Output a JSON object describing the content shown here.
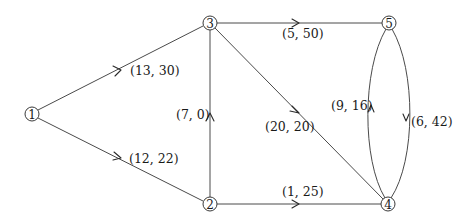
{
  "diagram": {
    "type": "directed-network-flow-graph",
    "nodes": [
      {
        "id": "1",
        "label": "1",
        "x": 32,
        "y": 114
      },
      {
        "id": "2",
        "label": "2",
        "x": 210,
        "y": 204
      },
      {
        "id": "3",
        "label": "3",
        "x": 210,
        "y": 23
      },
      {
        "id": "4",
        "label": "4",
        "x": 388,
        "y": 204
      },
      {
        "id": "5",
        "label": "5",
        "x": 389,
        "y": 23
      }
    ],
    "edges": [
      {
        "from": "1",
        "to": "3",
        "label": "(13, 30)"
      },
      {
        "from": "1",
        "to": "2",
        "label": "(12, 22)"
      },
      {
        "from": "2",
        "to": "3",
        "label": "(7, 0)"
      },
      {
        "from": "3",
        "to": "5",
        "label": "(5, 50)"
      },
      {
        "from": "3",
        "to": "4",
        "label": "(20, 20)"
      },
      {
        "from": "2",
        "to": "4",
        "label": "(1, 25)"
      },
      {
        "from": "4",
        "to": "5",
        "label": "(9, 16)"
      },
      {
        "from": "5",
        "to": "4",
        "label": "(6, 42)"
      }
    ]
  }
}
